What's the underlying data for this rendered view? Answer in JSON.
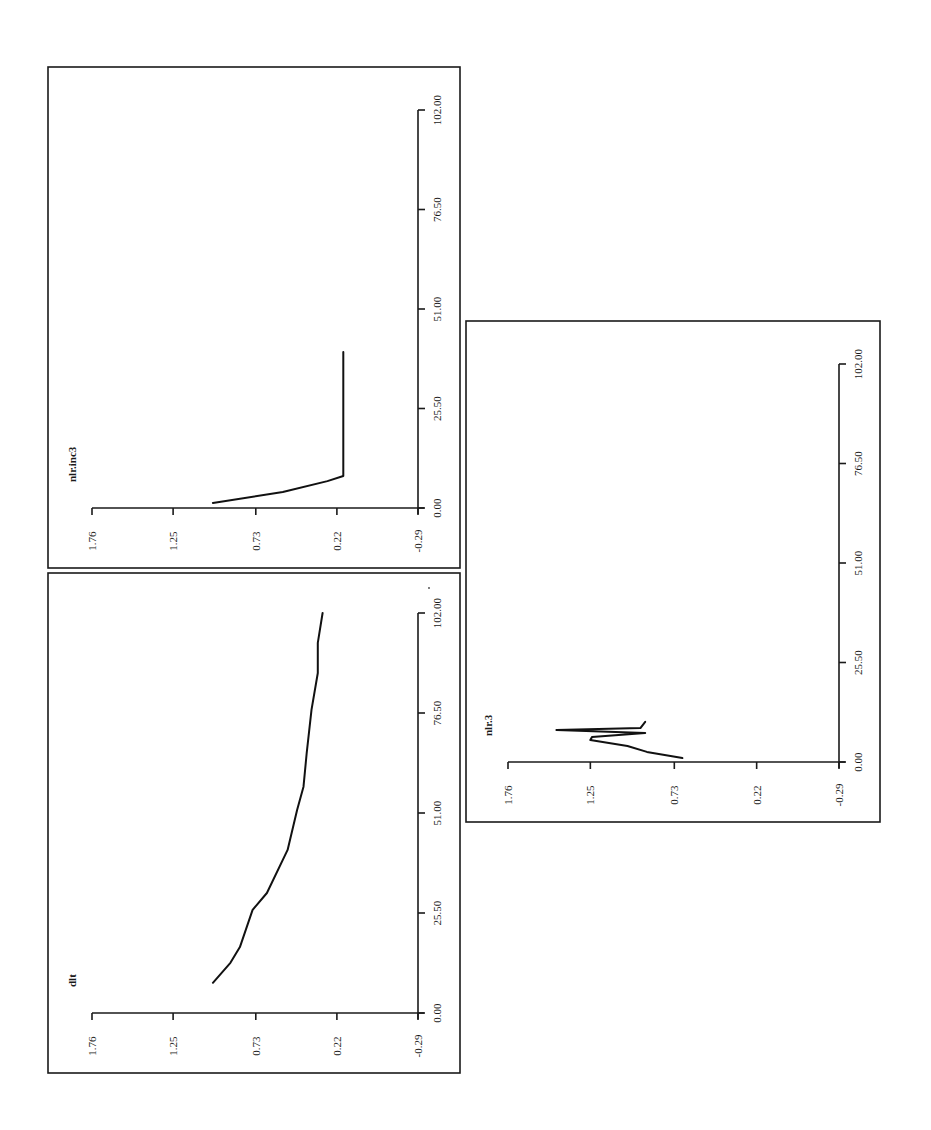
{
  "page": {
    "background": "#ffffff",
    "ink_color": "#1a1a1a",
    "orientation": "rotated 90deg counter-clockwise (value axis runs horizontally, time axis runs vertically upward)"
  },
  "chart_data": [
    {
      "id": "nlr_inc3",
      "type": "line",
      "title": "nlr.inc3",
      "xlabel": "",
      "ylabel": "",
      "x_ticks": [
        "0.00",
        "25.50",
        "51.00",
        "76.50",
        "102.00"
      ],
      "y_ticks": [
        "-0.29",
        "0.22",
        "0.73",
        "1.25",
        "1.76"
      ],
      "xlim": [
        0,
        102
      ],
      "ylim": [
        -0.29,
        1.76
      ],
      "grid": false,
      "series": [
        {
          "name": "nlr.inc3",
          "x": [
            1.3,
            4.1,
            6.9,
            8.2,
            40.0
          ],
          "y": [
            1.0,
            0.56,
            0.28,
            0.18,
            0.18
          ]
        }
      ],
      "frame": {
        "left": 48,
        "top": 67,
        "right": 460,
        "bottom": 568
      },
      "axes_px": {
        "value_min_x": 418,
        "value_max_x": 92,
        "time_zero_y": 508,
        "time_max_y": 110
      }
    },
    {
      "id": "dlt",
      "type": "line",
      "title": "dlt",
      "xlabel": "",
      "ylabel": "",
      "x_ticks": [
        "0.00",
        "25.50",
        "51.00",
        "76.50",
        "102.00"
      ],
      "y_ticks": [
        "-0.29",
        "0.22",
        "0.73",
        "1.25",
        "1.76"
      ],
      "xlim": [
        0,
        102
      ],
      "ylim": [
        -0.29,
        1.76
      ],
      "grid": false,
      "series": [
        {
          "name": "dlt",
          "x": [
            7.7,
            12.8,
            16.8,
            26.3,
            30.6,
            41.6,
            51.8,
            57.7,
            66.3,
            77.3,
            86.7,
            94.4,
            102.0
          ],
          "y": [
            1.0,
            0.89,
            0.83,
            0.75,
            0.66,
            0.53,
            0.47,
            0.43,
            0.41,
            0.38,
            0.34,
            0.34,
            0.31
          ]
        }
      ],
      "frame": {
        "left": 48,
        "top": 573,
        "right": 460,
        "bottom": 1073
      },
      "axes_px": {
        "value_min_x": 418,
        "value_max_x": 92,
        "time_zero_y": 1013,
        "time_max_y": 613
      }
    },
    {
      "id": "nlr_3",
      "type": "line",
      "title": "nlr.3",
      "xlabel": "",
      "ylabel": "",
      "x_ticks": [
        "0.00",
        "25.50",
        "51.00",
        "76.50",
        "102.00"
      ],
      "y_ticks": [
        "-0.29",
        "0.22",
        "0.73",
        "1.25",
        "1.76"
      ],
      "xlim": [
        0,
        102
      ],
      "ylim": [
        -0.29,
        1.76
      ],
      "grid": false,
      "series": [
        {
          "name": "nlr.3",
          "x": [
            1.0,
            2.6,
            4.1,
            5.6,
            6.4,
            7.4,
            8.2,
            8.7,
            10.3
          ],
          "y": [
            0.68,
            0.9,
            1.02,
            1.25,
            1.24,
            0.91,
            1.46,
            0.94,
            0.91
          ]
        }
      ],
      "frame": {
        "left": 466,
        "top": 321,
        "right": 880,
        "bottom": 822
      },
      "axes_px": {
        "value_min_x": 839,
        "value_max_x": 508,
        "time_zero_y": 762,
        "time_max_y": 364
      }
    }
  ]
}
